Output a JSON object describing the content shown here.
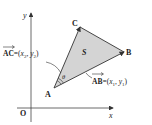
{
  "diagram": {
    "axes": {
      "x_label": "x",
      "y_label": "y",
      "origin_label": "O"
    },
    "vertices": {
      "A": "A",
      "B": "B",
      "C": "C"
    },
    "area_label": "S",
    "angle_label": "θ",
    "vector_AC": {
      "name": "AC",
      "eq": "=(",
      "x": "x",
      "x_sub": "2",
      "sep": ", ",
      "y": "y",
      "y_sub": "2",
      "close": ")"
    },
    "vector_AB": {
      "name": "AB",
      "eq": "=(",
      "x": "x",
      "x_sub": "1",
      "sep": ", ",
      "y": "y",
      "y_sub": "1",
      "close": ")"
    },
    "colors": {
      "triangle_fill": "#d4d4d4",
      "stroke": "#333333"
    }
  }
}
